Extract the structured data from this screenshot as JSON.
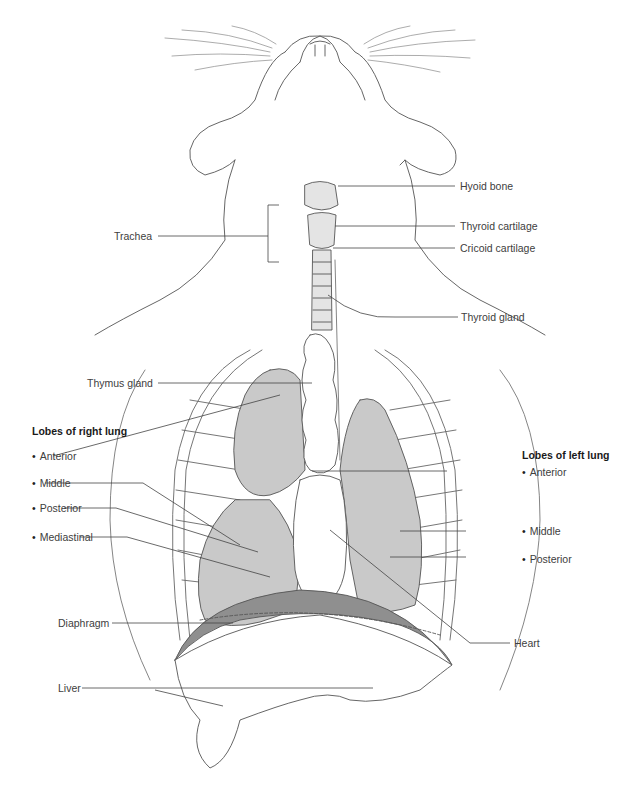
{
  "diagram": {
    "colors": {
      "lung_fill": "#c9c9c9",
      "diaphragm_fill": "#8f8f8f",
      "cartilage_fill": "#e4e4e4",
      "line": "#555555",
      "label_text": "#404040"
    },
    "labels": {
      "hyoid_bone": "Hyoid bone",
      "thyroid_cartilage": "Thyroid cartilage",
      "cricoid_cartilage": "Cricoid cartilage",
      "trachea": "Trachea",
      "thyroid_gland": "Thyroid gland",
      "thymus_gland": "Thymus gland",
      "diaphragm": "Diaphragm",
      "heart": "Heart",
      "liver": "Liver"
    },
    "right_lung": {
      "heading": "Lobes of right lung",
      "lobes": [
        "Anterior",
        "Middle",
        "Posterior",
        "Mediastinal"
      ]
    },
    "left_lung": {
      "heading": "Lobes of left lung",
      "lobes": [
        "Anterior",
        "Middle",
        "Posterior"
      ]
    }
  }
}
